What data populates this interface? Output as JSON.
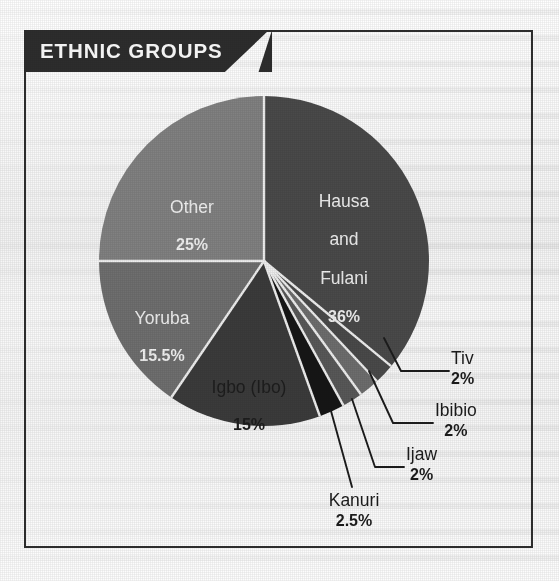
{
  "banner": {
    "title": "ETHNIC GROUPS"
  },
  "colors": {
    "frame": "#2e2e2e",
    "banner_bg": "#2d2d2d",
    "banner_text": "#f2f2f2",
    "paper": "#f4f4f4",
    "hausa_and_fulani": "#4a4a4a",
    "other": "#818181",
    "yoruba": "#6f6f6f",
    "igbo": "#3b3b3b",
    "kanuri": "#161616",
    "ijaw": "#585858",
    "ibibio": "#6d6d6d",
    "tiv": "#4a4a4a",
    "slice_divider": "#efefef",
    "leader_line": "#1c1c1c",
    "label_light": "#f0f0f0",
    "label_dark": "#1d1d1d"
  },
  "chart_data": {
    "type": "pie",
    "title": "ETHNIC GROUPS",
    "unit": "%",
    "total": 100,
    "start_angle_deg": 0,
    "direction": "clockwise",
    "legend": "none",
    "labels": [
      "Hausa and Fulani",
      "Tiv",
      "Ibibio",
      "Ijaw",
      "Kanuri",
      "Igbo (Ibo)",
      "Yoruba",
      "Other"
    ],
    "values": [
      36,
      2,
      2,
      2,
      2.5,
      15,
      15.5,
      25
    ],
    "slices": [
      {
        "name": "Hausa and Fulani",
        "name_lines": [
          "Hausa",
          "and",
          "Fulani"
        ],
        "value": 36,
        "percent_label": "36%",
        "color": "#4a4a4a",
        "label_placement": "inside",
        "label_color": "light"
      },
      {
        "name": "Tiv",
        "name_lines": [
          "Tiv"
        ],
        "value": 2,
        "percent_label": "2%",
        "color": "#4a4a4a",
        "label_placement": "callout",
        "label_color": "dark"
      },
      {
        "name": "Ibibio",
        "name_lines": [
          "Ibibio"
        ],
        "value": 2,
        "percent_label": "2%",
        "color": "#6d6d6d",
        "label_placement": "callout",
        "label_color": "dark"
      },
      {
        "name": "Ijaw",
        "name_lines": [
          "Ijaw"
        ],
        "value": 2,
        "percent_label": "2%",
        "color": "#585858",
        "label_placement": "callout",
        "label_color": "dark"
      },
      {
        "name": "Kanuri",
        "name_lines": [
          "Kanuri"
        ],
        "value": 2.5,
        "percent_label": "2.5%",
        "color": "#161616",
        "label_placement": "callout",
        "label_color": "dark"
      },
      {
        "name": "Igbo (Ibo)",
        "name_lines": [
          "Igbo (Ibo)"
        ],
        "value": 15,
        "percent_label": "15%",
        "color": "#3b3b3b",
        "label_placement": "inside",
        "label_color": "dark"
      },
      {
        "name": "Yoruba",
        "name_lines": [
          "Yoruba"
        ],
        "value": 15.5,
        "percent_label": "15.5%",
        "color": "#6f6f6f",
        "label_placement": "inside",
        "label_color": "light"
      },
      {
        "name": "Other",
        "name_lines": [
          "Other"
        ],
        "value": 25,
        "percent_label": "25%",
        "color": "#818181",
        "label_placement": "inside",
        "label_color": "light"
      }
    ]
  },
  "slice_labels": {
    "hausa_name_1": "Hausa",
    "hausa_name_2": "and",
    "hausa_name_3": "Fulani",
    "hausa_pct": "36%",
    "other_name": "Other",
    "other_pct": "25%",
    "yoruba_name": "Yoruba",
    "yoruba_pct": "15.5%",
    "igbo_name": "Igbo (Ibo)",
    "igbo_pct": "15%"
  },
  "callout_labels": {
    "tiv_name": "Tiv",
    "tiv_pct": "2%",
    "ibibio_name": "Ibibio",
    "ibibio_pct": "2%",
    "ijaw_name": "Ijaw",
    "ijaw_pct": "2%",
    "kanuri_name": "Kanuri",
    "kanuri_pct": "2.5%"
  }
}
